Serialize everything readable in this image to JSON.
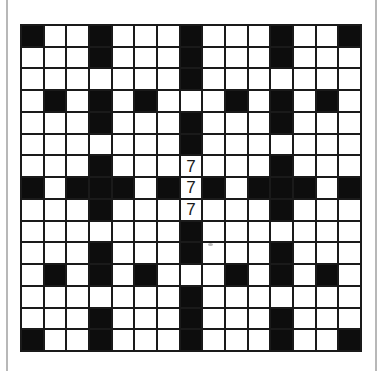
{
  "puzzle": {
    "rows": 15,
    "cols": 15,
    "layout": [
      "#..#...#...#..#",
      "...#...#...#...",
      ".......#.......",
      ".#.#.#...#.#.#.",
      "...#...#...#...",
      ".......#.......",
      "...#...7...#...",
      "#.###.#7#.###.#",
      "...#...7...#...",
      ".......#.......",
      "...#...#...#...",
      ".#.#.#...#.#.#.",
      ".......#.......",
      "...#...#...#...",
      "#..#...#...#..#"
    ],
    "filled_cells": [
      {
        "row": 6,
        "col": 7,
        "value": "7"
      },
      {
        "row": 7,
        "col": 7,
        "value": "7"
      },
      {
        "row": 8,
        "col": 7,
        "value": "7"
      }
    ]
  },
  "colors": {
    "block": "#0d0d0d",
    "cell": "#ffffff",
    "grid_line": "#1a1a1a",
    "side_rule": "#b8b8b8"
  }
}
